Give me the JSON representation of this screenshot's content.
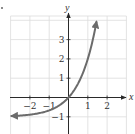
{
  "chart_data": {
    "type": "line",
    "title": "",
    "function": "y = 3^x - 1",
    "xlabel": "x",
    "ylabel": "y",
    "xlim": [
      -3,
      3
    ],
    "ylim": [
      -1.95,
      4.2
    ],
    "grid": true,
    "x_ticks": [
      -2,
      -1,
      1,
      2
    ],
    "x_tick_labels": [
      "−2",
      "−1",
      "1",
      "2"
    ],
    "y_ticks": [
      3,
      2,
      1,
      -1
    ],
    "y_tick_labels": [
      "3",
      "2",
      "1",
      "−1"
    ],
    "series": [
      {
        "name": "curve",
        "color": "#6b6b6b",
        "x": [
          -2.95,
          -2.5,
          -2,
          -1.5,
          -1,
          -0.5,
          0,
          0.25,
          0.5,
          0.75,
          1,
          1.25,
          1.45
        ],
        "y": [
          -0.96,
          -0.94,
          -0.89,
          -0.81,
          -0.67,
          -0.42,
          0,
          0.32,
          0.73,
          1.28,
          2,
          2.95,
          3.92
        ],
        "arrows": "both"
      }
    ],
    "asymptote": {
      "y": -1
    }
  },
  "colors": {
    "grid": "#dcdcdc",
    "axis": "#2a2a2a",
    "curve": "#6b6b6b",
    "text": "#333333"
  }
}
